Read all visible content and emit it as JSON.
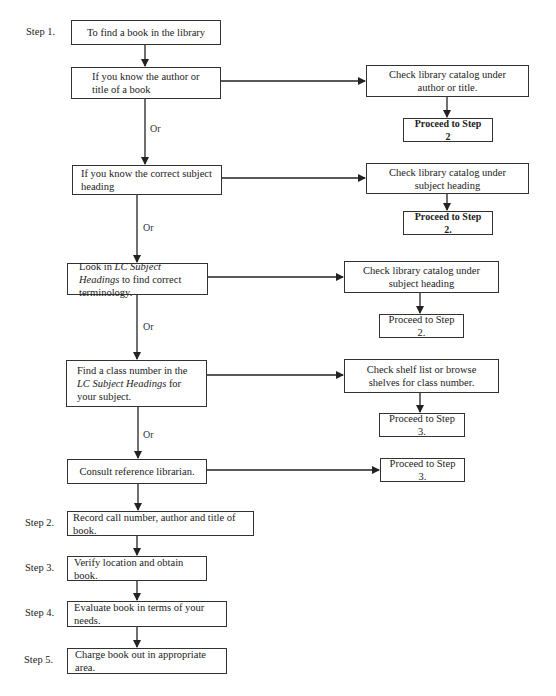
{
  "diagram": {
    "type": "flowchart",
    "step_labels": [
      "Step 1.",
      "Step 2.",
      "Step 3.",
      "Step 4.",
      "Step 5."
    ],
    "or_label": "Or",
    "left_column": [
      {
        "id": "start",
        "text": "To find a book in the library"
      },
      {
        "id": "know_author",
        "text": "If you know the author or title of a book"
      },
      {
        "id": "know_subject",
        "text": "If you know the correct subject heading"
      },
      {
        "id": "lc_headings",
        "text_pre": "Look in ",
        "text_italic": "LC Subject Headings",
        "text_post": " to find correct terminology."
      },
      {
        "id": "class_number",
        "text_pre": "Find a class number in the ",
        "text_italic": "LC Subject Headings",
        "text_post": " for your subject."
      },
      {
        "id": "consult",
        "text": "Consult reference librarian."
      }
    ],
    "right_column": [
      {
        "id": "check_author",
        "text": "Check library catalog under author or title.",
        "proceed": "Proceed to Step 2"
      },
      {
        "id": "check_subject",
        "text": "Check library catalog under subject heading",
        "proceed": "Proceed to Step 2."
      },
      {
        "id": "check_subject_lc",
        "text": "Check library catalog under subject heading",
        "proceed": "Proceed to Step 2."
      },
      {
        "id": "check_shelf",
        "text": "Check shelf list or browse shelves for class number.",
        "proceed": "Proceed to Step 3."
      },
      {
        "id": "consult_result",
        "proceed": "Proceed to Step 3."
      }
    ],
    "steps": [
      {
        "id": "step2",
        "text": "Record call number, author and title of book."
      },
      {
        "id": "step3",
        "text": "Verify location and obtain book."
      },
      {
        "id": "step4",
        "text": "Evaluate book in terms of your needs."
      },
      {
        "id": "step5",
        "text": "Charge book out in appropriate area."
      }
    ]
  }
}
